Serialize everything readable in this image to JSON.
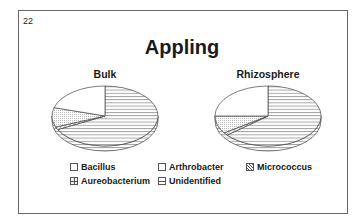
{
  "slide": {
    "number": "22",
    "title": "Appling"
  },
  "pies": [
    {
      "label": "Bulk"
    },
    {
      "label": "Rhizosphere"
    }
  ],
  "legend": [
    {
      "label": "Bacillus",
      "pattern": "blank"
    },
    {
      "label": "Arthrobacter",
      "pattern": "blank"
    },
    {
      "label": "Micrococcus",
      "pattern": "diagonal-hatch"
    },
    {
      "label": "Aureobacterium",
      "pattern": "grid"
    },
    {
      "label": "Unidentified",
      "pattern": "horizontal-lines"
    }
  ],
  "chart_data": [
    {
      "type": "pie",
      "title": "Bulk",
      "categories": [
        "Unidentified",
        "Micrococcus",
        "Aureobacterium",
        "Bacillus/Arthrobacter"
      ],
      "values": [
        67.5,
        1.5,
        10.5,
        20.5
      ],
      "units": "percent (estimated)"
    },
    {
      "type": "pie",
      "title": "Rhizosphere",
      "categories": [
        "Unidentified",
        "Micrococcus",
        "Aureobacterium",
        "Bacillus/Arthrobacter"
      ],
      "values": [
        64,
        1.5,
        9.5,
        25
      ],
      "units": "percent (estimated)"
    }
  ],
  "figure_title": "Appling",
  "legend_position": "bottom"
}
